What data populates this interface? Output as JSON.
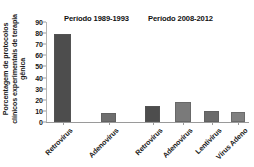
{
  "chart_data": {
    "type": "bar",
    "title": "",
    "subtitle": "",
    "xlabel": "",
    "ylabel": "Porcentagem de protocolos clínicos experimentais de terapia gênica",
    "categories": [
      "Retrovírus",
      "Adenovírus",
      "Retrovírus",
      "Adenovírus",
      "Lentivírus",
      "Vírus Adeno"
    ],
    "values": [
      79,
      8,
      14,
      18,
      10,
      9
    ],
    "ylim": [
      0,
      90
    ],
    "yticks": [
      0,
      10,
      20,
      30,
      40,
      50,
      60,
      70,
      80,
      90
    ],
    "ytick_labels": [
      "0",
      "10",
      "20",
      "30",
      "40",
      "50",
      "60",
      "70",
      "80",
      "90"
    ],
    "grid": false,
    "legend": "none",
    "bar_colors": [
      "#4d4d4d",
      "#6e6e6e",
      "#4d4d4d",
      "#7a7a7a",
      "#6b6b6b",
      "#808080"
    ],
    "annotations": [
      {
        "text": "Período 1989-1993",
        "group_start": 0,
        "group_end": 1
      },
      {
        "text": "Período 2008-2012",
        "group_start": 2,
        "group_end": 5
      }
    ],
    "groups": [
      {
        "label": "Período 1989-1993",
        "categories": [
          "Retrovírus",
          "Adenovírus"
        ],
        "values": [
          79,
          8
        ]
      },
      {
        "label": "Período 2008-2012",
        "categories": [
          "Retrovírus",
          "Adenovírus",
          "Lentivírus",
          "Vírus Adeno"
        ],
        "values": [
          14,
          18,
          10,
          9
        ]
      }
    ]
  },
  "axis": {
    "y_title": "Porcentagem de protocolos clínicos experimentais de terapia gênica",
    "ticks": [
      "90",
      "80",
      "70",
      "60",
      "50",
      "40",
      "30",
      "20",
      "10",
      "0"
    ]
  },
  "periods": {
    "first": "Período 1989-1993",
    "second": "Período 2008-2012"
  },
  "categories": {
    "c0": "Retrovírus",
    "c1": "Adenovírus",
    "c2": "Retrovírus",
    "c3": "Adenovírus",
    "c4": "Lentivírus",
    "c5": "Vírus Adeno"
  }
}
